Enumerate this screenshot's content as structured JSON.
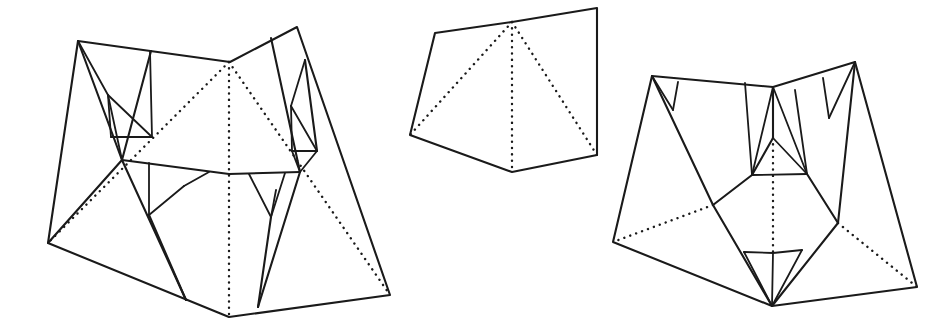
{
  "page": {
    "background_color": "#ffffff",
    "line_color": "#1a1a1a",
    "width": 949,
    "height": 332
  },
  "legend": {
    "solid_line_meaning": "mountain / cut edge",
    "dotted_line_meaning": "hidden / valley fold edge"
  },
  "figures": [
    {
      "id": "figure-left",
      "name": "left-crease-pattern",
      "label": "",
      "outline": "78,41 230,62 297,27 390,295 229,317 48,243",
      "dotted_edges": [
        "229,62 48,243",
        "229,62 229,317",
        "229,62 390,295"
      ],
      "solid_edges": [
        "78,41 122,160",
        "122,160 48,243",
        "122,160 229,317",
        "150,50 122,160",
        "78,41 110,96",
        "110,96 150,136",
        "150,136 112,137",
        "112,137 110,96",
        "110,96 122,160",
        "150,136 122,160",
        "271,38 297,148",
        "297,148 229,317",
        "271,38 299,130",
        "299,130 310,160",
        "310,160 297,148",
        "299,130 303,150",
        "303,150 297,148",
        "297,148 305,60",
        "122,160 208,175",
        "208,175 297,172",
        "149,172 149,215",
        "149,215 182,186",
        "182,186 208,175",
        "149,172 149,215",
        "271,175 286,215",
        "286,215 264,190",
        "264,190 250,175",
        "286,175 286,215",
        "149,215 185,300",
        "286,215 258,307",
        "297,172 297,148"
      ]
    },
    {
      "id": "figure-middle",
      "name": "middle-crease-pattern",
      "label": "",
      "outline": "435,33 512,22 597,8 597,155 512,172 410,135",
      "dotted_edges": [
        "512,22 410,135",
        "512,22 512,172",
        "512,22 597,155"
      ],
      "solid_edges": []
    },
    {
      "id": "figure-right",
      "name": "right-crease-pattern",
      "label": "",
      "outline": "652,76 773,87 855,62 917,287 772,306 613,242"
    }
  ],
  "annotations": []
}
